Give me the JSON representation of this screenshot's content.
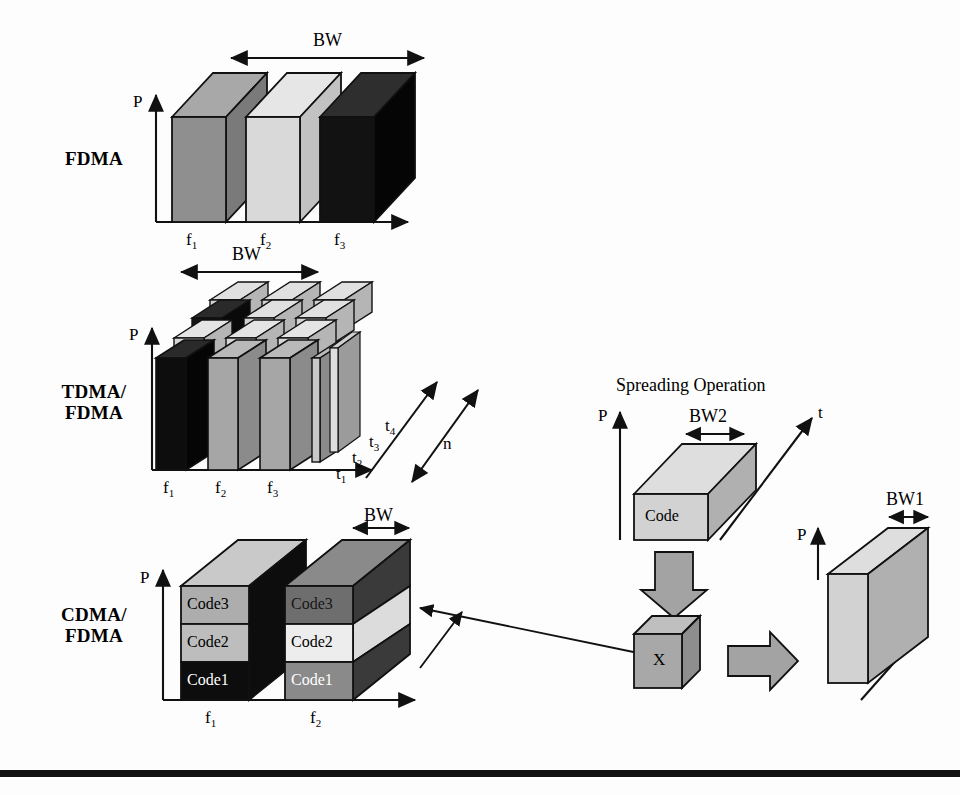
{
  "figure": {
    "background": "#fdfdfd",
    "ink": "#111111"
  },
  "row_labels": {
    "fdma": "FDMA",
    "tdma": "TDMA/\nFDMA",
    "tdma_line1": "TDMA/",
    "tdma_line2": "FDMA",
    "cdma_line1": "CDMA/",
    "cdma_line2": "FDMA"
  },
  "axes": {
    "power": "P",
    "time": "t",
    "depth": "n"
  },
  "fdma_panel": {
    "bw_label": "BW",
    "power_axis": "P",
    "freq_labels": [
      "f",
      "f",
      "f"
    ],
    "freq_subs": [
      "1",
      "2",
      "3"
    ],
    "blocks": [
      {
        "name": "f1",
        "front": "#8f8f8f",
        "top": "#a8a8a8",
        "side": "#7a7a7a"
      },
      {
        "name": "f2",
        "front": "#d9d9d9",
        "top": "#e6e6e6",
        "side": "#c2c2c2"
      },
      {
        "name": "f3",
        "front": "#121212",
        "top": "#2e2e2e",
        "side": "#050505"
      }
    ]
  },
  "tdma_panel": {
    "bw_label": "BW",
    "power_axis": "P",
    "depth_label": "n",
    "freq_labels": [
      "f",
      "f",
      "f"
    ],
    "freq_subs": [
      "1",
      "2",
      "3"
    ],
    "time_labels": [
      "t",
      "t",
      "t",
      "t"
    ],
    "time_subs": [
      "1",
      "2",
      "3",
      "4"
    ],
    "slot_count": 4,
    "freq_count": 3,
    "shades": {
      "dark": "#121212",
      "mid": "#8f8f8f",
      "light": "#d6d6d6",
      "lighter": "#e8e8e8"
    }
  },
  "cdma_panel": {
    "bw_label": "BW",
    "power_axis": "P",
    "freq_labels": [
      "f",
      "f"
    ],
    "freq_subs": [
      "1",
      "2"
    ],
    "code_labels": [
      "Code3",
      "Code2",
      "Code1"
    ],
    "block_f1": {
      "code3": {
        "label": "Code3",
        "fill": "#adadad",
        "text": "#000000"
      },
      "code2": {
        "label": "Code2",
        "fill": "#bdbdbd",
        "text": "#000000"
      },
      "code1": {
        "label": "Code1",
        "fill": "#0d0d0d",
        "text": "#ffffff"
      },
      "top": "#c9c9c9",
      "side": "#0d0d0d"
    },
    "block_f2": {
      "code3": {
        "label": "Code3",
        "fill": "#6e6e6e",
        "text": "#111111"
      },
      "code2": {
        "label": "Code2",
        "fill": "#ededed",
        "text": "#000000"
      },
      "code1": {
        "label": "Code1",
        "fill": "#8a8a8a",
        "text": "#ffffff"
      },
      "top": "#8a8a8a",
      "side_dark": "#3a3a3a",
      "side_light": "#dcdcdc"
    }
  },
  "spreading_panel": {
    "title": "Spreading Operation",
    "power_axis": "P",
    "time_axis": "t",
    "bw2_label": "BW2",
    "bw1_label": "BW1",
    "code_block_label": "Code",
    "multiplier_label": "X",
    "narrowband_power_axis": "P",
    "colors": {
      "block_front": "#d2d2d2",
      "block_top": "#dedede",
      "block_side": "#b0b0b0",
      "arrow_fill": "#a3a3a3",
      "cube_front": "#a8a8a8",
      "cube_top": "#bfbfbf",
      "cube_side": "#8e8e8e"
    }
  }
}
